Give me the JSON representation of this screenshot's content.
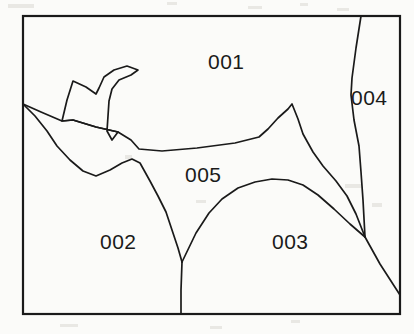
{
  "figure": {
    "kind": "region-map-line-drawing",
    "background_color": "#fbfbf9",
    "line_color": "#1a1a1a",
    "frame": {
      "x": 23,
      "y": 16,
      "width": 377,
      "height": 298,
      "stroke_width": 2.2
    },
    "regions": [
      {
        "id": "001",
        "label": "001",
        "label_x": 208,
        "label_y": 51
      },
      {
        "id": "002",
        "label": "002",
        "label_x": 100,
        "label_y": 231
      },
      {
        "id": "003",
        "label": "003",
        "label_x": 272,
        "label_y": 231
      },
      {
        "id": "004",
        "label": "004",
        "label_x": 351,
        "label_y": 87
      },
      {
        "id": "005",
        "label": "005",
        "label_x": 185,
        "label_y": 164
      }
    ],
    "boundaries": [
      {
        "name": "region-001-002-005-boundary",
        "description": "jagged spur from left frame edge sweeping right through the middle of the map",
        "points": "23,104 41,112 62,121 73,120 96,127 118,132 131,140 139,149 162,151 197,148 235,143 259,137 268,129 278,118 288,109 292,104 298,119 303,134 313,152 323,166 336,181 347,196 356,214 365,237"
      },
      {
        "name": "region-001-spur-zigzag",
        "description": "narrow zigzag peninsula of region 002 intruding upward into region 001",
        "points": "62,121 67,100 73,81 86,87 96,94 99,88 104,77 114,70 127,66 138,70 131,75 119,80 112,89 109,101 108,116 107,131 112,140 118,132 96,127 73,120 62,121"
      },
      {
        "name": "region-002-005-boundary",
        "description": "lower boundary of region 005 against region 002",
        "points": "23,104 35,116 47,131 57,146 70,160 83,171 96,176 110,170 122,163 132,159 140,163 145,172 150,181 158,196 166,212 172,230 178,248 182,262"
      },
      {
        "name": "region-002-003-boundary",
        "description": "vertical divide from V junction down to bottom frame",
        "points": "182,262 181,290 181,314"
      },
      {
        "name": "region-003-005-boundary",
        "description": "arched boundary between region 003 and region 005",
        "points": "182,262 196,233 209,213 222,199 238,188 255,182 272,179 288,180 303,185 318,195 334,209 350,224 365,237"
      },
      {
        "name": "region-004-boundary",
        "description": "near-vertical boundary of region 004 from top frame down to triple junction",
        "points": "361,16 356,48 352,78 351,95 354,120 359,146 361,172 363,200 365,237"
      },
      {
        "name": "region-003-004-boundary",
        "description": "diagonal from triple junction to right frame edge",
        "points": "365,237 380,264 400,295"
      }
    ]
  },
  "artifacts": {
    "description": "faint scanner speckles and ghost marks visible on the off-white paper background",
    "marks": [
      {
        "x": 8,
        "y": 4,
        "width": 26,
        "height": 4
      },
      {
        "x": 167,
        "y": 2,
        "width": 10,
        "height": 3
      },
      {
        "x": 248,
        "y": 6,
        "width": 14,
        "height": 3
      },
      {
        "x": 300,
        "y": 3,
        "width": 8,
        "height": 3
      },
      {
        "x": 337,
        "y": 8,
        "width": 12,
        "height": 3
      },
      {
        "x": 125,
        "y": 155,
        "width": 7,
        "height": 4
      },
      {
        "x": 196,
        "y": 200,
        "width": 10,
        "height": 3
      },
      {
        "x": 345,
        "y": 184,
        "width": 16,
        "height": 4
      },
      {
        "x": 372,
        "y": 203,
        "width": 10,
        "height": 4
      },
      {
        "x": 210,
        "y": 326,
        "width": 12,
        "height": 3
      },
      {
        "x": 291,
        "y": 320,
        "width": 9,
        "height": 3
      },
      {
        "x": 60,
        "y": 324,
        "width": 18,
        "height": 3
      }
    ]
  }
}
